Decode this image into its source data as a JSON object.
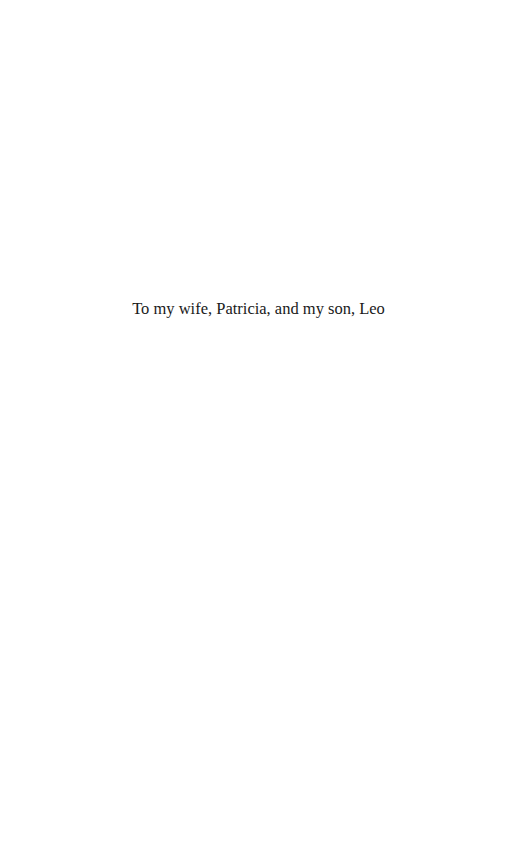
{
  "page": {
    "dedication": "To my wife, Patricia, and my son, Leo"
  }
}
